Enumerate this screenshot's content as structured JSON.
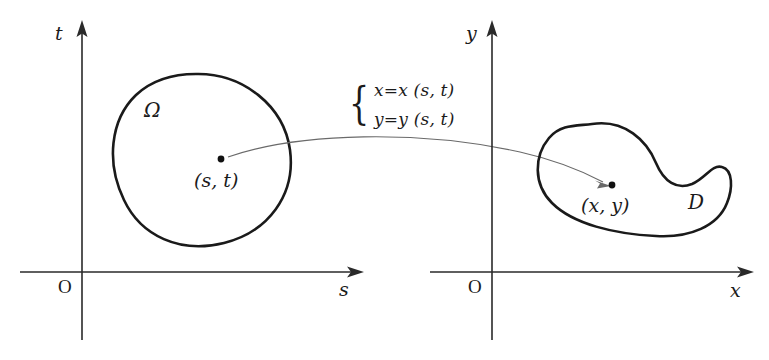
{
  "figure": {
    "background_color": "#ffffff",
    "outline_color": "#1a1a1a",
    "axis_color": "#2a2a2a",
    "arrow_color": "#6a6a6a"
  },
  "left_panel": {
    "vertical_axis_label": "t",
    "horizontal_axis_label": "s",
    "origin_label": "O",
    "region_label": "Ω",
    "point_label": "(s, t)"
  },
  "right_panel": {
    "vertical_axis_label": "y",
    "horizontal_axis_label": "x",
    "origin_label": "O",
    "region_label": "D",
    "point_label": "(x, y)"
  },
  "mapping": {
    "brace": "{",
    "equation_1": "x=x (s, t)",
    "equation_2": "y=y (s, t)"
  }
}
